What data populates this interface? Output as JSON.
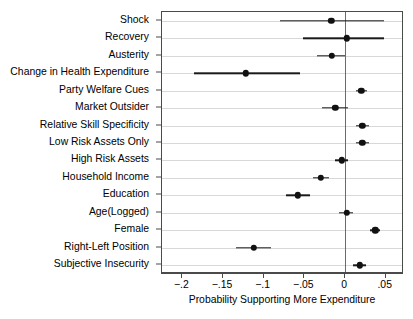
{
  "chart_data": {
    "type": "scatter",
    "subtype": "coefficient-plot-with-confidence-intervals",
    "title": "",
    "xlabel": "Probability Supporting More Expenditure",
    "ylabel": "",
    "xlim": [
      -0.225,
      0.0725
    ],
    "xticks": [
      -0.2,
      -0.15,
      -0.1,
      -0.05,
      0,
      0.05
    ],
    "xticklabels": [
      "−.2",
      "−.15",
      "−.1",
      "−.05",
      "0",
      ".05"
    ],
    "grid": "horizontal",
    "legend": "none",
    "reference_line": 0,
    "categories": [
      "Shock",
      "Recovery",
      "Austerity",
      "Change in Health Expenditure",
      "Party Welfare Cues",
      "Market Outsider",
      "Relative Skill Specificity",
      "Low Risk Assets Only",
      "High Risk Assets",
      "Household Income",
      "Education",
      "Age(Logged)",
      "Female",
      "Right-Left Position",
      "Subjective Insecurity"
    ],
    "points": [
      {
        "label": "Shock",
        "estimate": -0.017,
        "ci_low": -0.08,
        "ci_high": 0.048
      },
      {
        "label": "Recovery",
        "estimate": 0.002,
        "ci_low": -0.052,
        "ci_high": 0.048
      },
      {
        "label": "Austerity",
        "estimate": -0.016,
        "ci_low": -0.034,
        "ci_high": 0.0
      },
      {
        "label": "Change in Health Expenditure",
        "estimate": -0.122,
        "ci_low": -0.186,
        "ci_high": -0.055
      },
      {
        "label": "Party Welfare Cues",
        "estimate": 0.02,
        "ci_low": 0.014,
        "ci_high": 0.027
      },
      {
        "label": "Market Outsider",
        "estimate": -0.012,
        "ci_low": -0.028,
        "ci_high": 0.004
      },
      {
        "label": "Relative Skill Specificity",
        "estimate": 0.021,
        "ci_low": 0.014,
        "ci_high": 0.029
      },
      {
        "label": "Low Risk Assets Only",
        "estimate": 0.021,
        "ci_low": 0.013,
        "ci_high": 0.03
      },
      {
        "label": "High Risk Assets",
        "estimate": -0.004,
        "ci_low": -0.012,
        "ci_high": 0.004
      },
      {
        "label": "Household Income",
        "estimate": -0.03,
        "ci_low": -0.039,
        "ci_high": -0.02
      },
      {
        "label": "Education",
        "estimate": -0.058,
        "ci_low": -0.073,
        "ci_high": -0.043
      },
      {
        "label": "Age(Logged)",
        "estimate": 0.002,
        "ci_low": -0.007,
        "ci_high": 0.01
      },
      {
        "label": "Female",
        "estimate": 0.037,
        "ci_low": 0.031,
        "ci_high": 0.043
      },
      {
        "label": "Right-Left Position",
        "estimate": -0.112,
        "ci_low": -0.134,
        "ci_high": -0.091
      },
      {
        "label": "Subjective Insecurity",
        "estimate": 0.018,
        "ci_low": 0.01,
        "ci_high": 0.026
      }
    ],
    "colors": {
      "point": "#111111",
      "ci": "#1a1a1a",
      "gridline": "#d8d8d8",
      "axis": "#4a4a4a",
      "zero_line": "#6b6b6b",
      "background": "#ffffff"
    }
  }
}
